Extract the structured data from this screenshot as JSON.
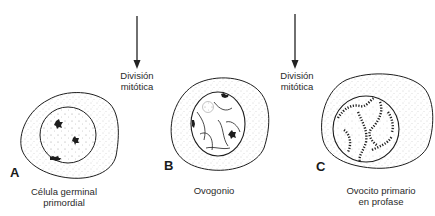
{
  "figure": {
    "top_cropped_caption": "",
    "arrows": [
      {
        "label_line1": "División",
        "label_line2": "mitótica"
      },
      {
        "label_line1": "División",
        "label_line2": "mitótica"
      }
    ],
    "cells": [
      {
        "letter": "A",
        "caption_line1": "Célula germinal",
        "caption_line2": "primordial"
      },
      {
        "letter": "B",
        "caption_line1": "Ovogonio",
        "caption_line2": ""
      },
      {
        "letter": "C",
        "caption_line1": "Ovocito primario",
        "caption_line2": "en profase"
      }
    ],
    "colors": {
      "line": "#1e1e1e",
      "stipple": "#9a9a9a",
      "background": "#ffffff"
    }
  }
}
